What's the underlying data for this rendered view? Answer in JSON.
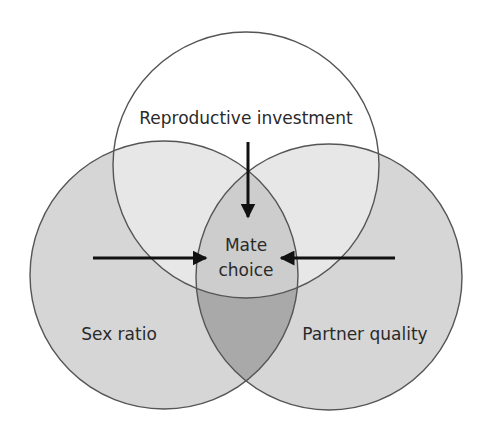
{
  "diagram": {
    "type": "venn",
    "circles": [
      {
        "id": "top",
        "label": "Reproductive investment",
        "cx": 246,
        "cy": 165,
        "r": 133
      },
      {
        "id": "left",
        "label": "Sex ratio",
        "cx": 164,
        "cy": 275,
        "r": 134
      },
      {
        "id": "right",
        "label": "Partner quality",
        "cx": 329,
        "cy": 277,
        "r": 133
      }
    ],
    "center_label_line1": "Mate",
    "center_label_line2": "choice",
    "arrows": [
      {
        "from": "Reproductive investment",
        "to": "Mate choice",
        "direction": "down"
      },
      {
        "from": "Sex ratio",
        "to": "Mate choice",
        "direction": "right"
      },
      {
        "from": "Partner quality",
        "to": "Mate choice",
        "direction": "left"
      }
    ],
    "colors": {
      "side_fill": "#d6d6d6",
      "side_overlap_fill": "#a9a9a9",
      "top_fill": "#ffffff",
      "outline": "#555555",
      "arrow": "#111111",
      "text": "#2a2a2a"
    }
  }
}
